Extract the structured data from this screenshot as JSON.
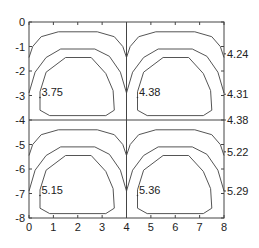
{
  "chart_data": {
    "type": "contour",
    "title": "",
    "xlabel": "",
    "ylabel": "",
    "xlim": [
      0,
      8
    ],
    "ylim": [
      -8,
      0
    ],
    "grid": false,
    "x_ticks": [
      "0",
      "1",
      "2",
      "3",
      "4",
      "5",
      "6",
      "7",
      "8"
    ],
    "y_ticks": [
      "0",
      "-1",
      "-2",
      "-3",
      "-4",
      "-5",
      "-6",
      "-7",
      "-8"
    ],
    "divider_lines": {
      "x": 4,
      "y": -4
    },
    "panels": [
      {
        "name": "top-left",
        "x0": 0,
        "y0": 0,
        "inline_label": "3.75"
      },
      {
        "name": "top-right",
        "x0": 4,
        "y0": 0,
        "inline_label": "4.38"
      },
      {
        "name": "bottom-left",
        "x0": 0,
        "y0": -4,
        "inline_label": "5.15"
      },
      {
        "name": "bottom-right",
        "x0": 4,
        "y0": -4,
        "inline_label": "5.36"
      }
    ],
    "right_labels": [
      {
        "y": -1.3,
        "text": "4.24"
      },
      {
        "y": -2.95,
        "text": "4.31"
      },
      {
        "y": -4.0,
        "text": "4.38"
      },
      {
        "y": -5.3,
        "text": "5.22"
      },
      {
        "y": -6.9,
        "text": "5.29"
      }
    ],
    "contour_levels_per_panel": 3,
    "line_color": "#555555"
  }
}
